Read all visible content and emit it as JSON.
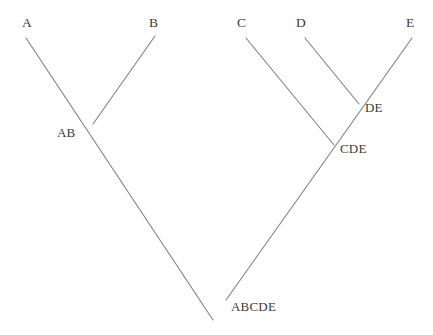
{
  "diagram": {
    "type": "cladogram",
    "title": "",
    "background_color": "#ffffff",
    "line_color": "#808080",
    "text_color": "#3a3a3a"
  },
  "taxa": [
    {
      "id": "A",
      "label": "A",
      "x": 22,
      "y": 16
    },
    {
      "id": "B",
      "label": "B",
      "x": 149,
      "y": 16
    },
    {
      "id": "C",
      "label": "C",
      "x": 237,
      "y": 16
    },
    {
      "id": "D",
      "label": "D",
      "x": 296,
      "y": 16
    },
    {
      "id": "E",
      "label": "E",
      "x": 406,
      "y": 16
    }
  ],
  "internal_nodes": [
    {
      "id": "AB",
      "label": "AB",
      "x": 57,
      "y": 126
    },
    {
      "id": "DE",
      "label": "DE",
      "x": 365,
      "y": 101
    },
    {
      "id": "CDE",
      "label": "CDE",
      "x": 340,
      "y": 142
    },
    {
      "id": "ABCDE",
      "label": "ABCDE",
      "x": 231,
      "y": 300
    }
  ],
  "branches": [
    {
      "id": "branch-a-root",
      "from": "A",
      "to": "ABCDE",
      "points": "26,38 213,320"
    },
    {
      "id": "branch-b-ab",
      "from": "B",
      "to": "AB",
      "points": "155,36 93,124"
    },
    {
      "id": "branch-e-root",
      "from": "E",
      "to": "ABCDE",
      "points": "412,38 226,300"
    },
    {
      "id": "branch-d-de",
      "from": "D",
      "to": "DE",
      "points": "305,38 359,104"
    },
    {
      "id": "branch-c-cde",
      "from": "C",
      "to": "CDE",
      "points": "246,38 334,145"
    }
  ]
}
